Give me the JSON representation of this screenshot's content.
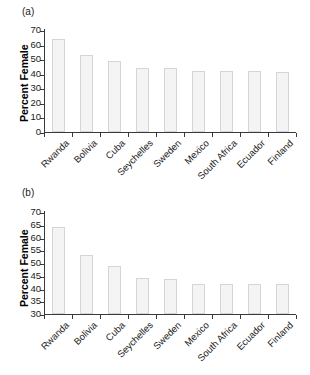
{
  "figure": {
    "panels": [
      {
        "tag": "(a)",
        "ylabel": "Percent Female",
        "yticks": [
          0,
          10,
          20,
          30,
          40,
          50,
          60,
          70
        ],
        "ylim": [
          0,
          70
        ]
      },
      {
        "tag": "(b)",
        "ylabel": "Percent Female",
        "yticks": [
          30,
          35,
          40,
          45,
          50,
          55,
          60,
          65,
          70
        ],
        "ylim": [
          30,
          70
        ]
      }
    ]
  },
  "chart_data": [
    {
      "type": "bar",
      "title": "(a)",
      "xlabel": "",
      "ylabel": "Percent Female",
      "ylim": [
        0,
        70
      ],
      "yticks": [
        0,
        10,
        20,
        30,
        40,
        50,
        60,
        70
      ],
      "grid": false,
      "legend": "none",
      "categories": [
        "Rwanda",
        "Bolivia",
        "Cuba",
        "Seychelles",
        "Sweden",
        "Mexico",
        "South Africa",
        "Ecuador",
        "Finland"
      ],
      "values": [
        64.0,
        53.0,
        49.0,
        44.0,
        43.6,
        41.8,
        41.8,
        41.8,
        41.5
      ]
    },
    {
      "type": "bar",
      "title": "(b)",
      "xlabel": "",
      "ylabel": "Percent Female",
      "ylim": [
        30,
        70
      ],
      "yticks": [
        30,
        35,
        40,
        45,
        50,
        55,
        60,
        65,
        70
      ],
      "grid": false,
      "legend": "none",
      "categories": [
        "Rwanda",
        "Bolivia",
        "Cuba",
        "Seychelles",
        "Sweden",
        "Mexico",
        "South Africa",
        "Ecuador",
        "Finland"
      ],
      "values": [
        64.0,
        53.0,
        49.0,
        44.0,
        43.9,
        41.8,
        41.9,
        41.9,
        41.8
      ]
    }
  ]
}
